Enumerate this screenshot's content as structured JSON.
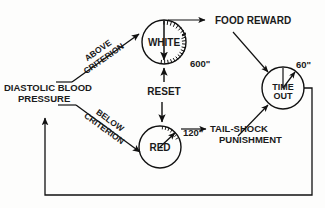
{
  "diagram": {
    "stroke_color": "#111111",
    "background_color": "#fdfdfc",
    "nodes": {
      "input": {
        "line1": "DIASTOLIC BLOOD",
        "line2": "PRESSURE"
      },
      "white": {
        "label": "WHITE",
        "timer": "600\""
      },
      "red": {
        "label": "RED",
        "timer": "120\""
      },
      "timeout": {
        "line1": "TIME",
        "line2": "OUT",
        "timer": "60\""
      },
      "food": {
        "label": "FOOD REWARD"
      },
      "shock": {
        "line1": "TAIL-SHOCK",
        "line2": "PUNISHMENT"
      }
    },
    "edges": {
      "above": {
        "line1": "ABOVE",
        "line2": "CRITERION"
      },
      "below": {
        "line1": "BELOW",
        "line2": "CRITERION"
      },
      "reset": {
        "label": "RESET"
      }
    }
  }
}
